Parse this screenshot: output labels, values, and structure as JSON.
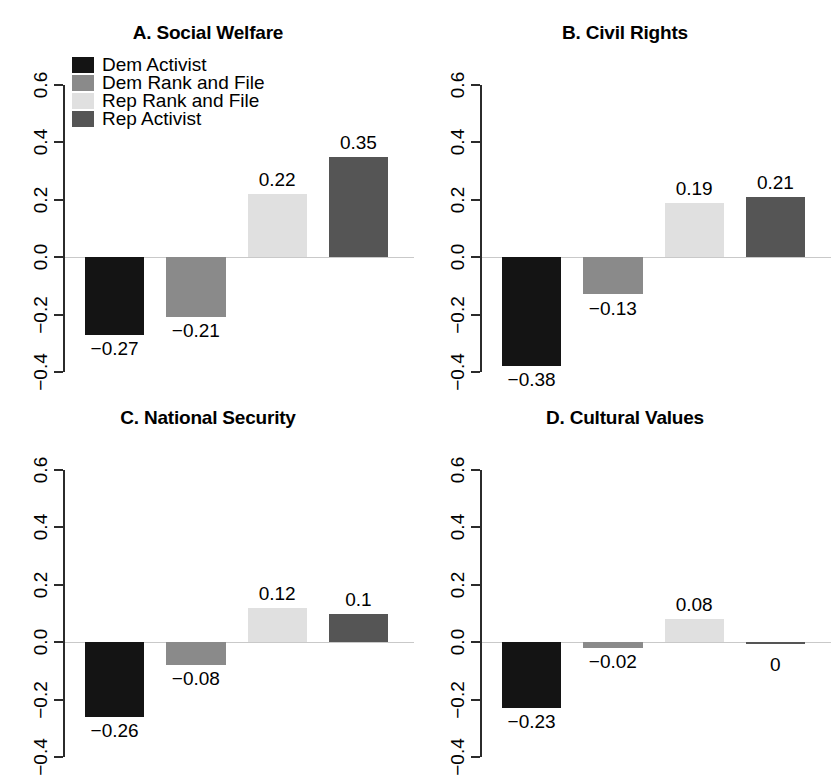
{
  "figure": {
    "width": 833,
    "height": 769,
    "background": "#ffffff"
  },
  "legend": {
    "position": "top-left-panel-a",
    "entries": [
      {
        "label": "Dem Activist",
        "color": "#141414"
      },
      {
        "label": "Dem Rank and File",
        "color": "#8a8a8a"
      },
      {
        "label": "Rep Rank and File",
        "color": "#e0e0e0"
      },
      {
        "label": "Rep Activist",
        "color": "#555555"
      }
    ]
  },
  "axis": {
    "ticks": [
      "0.6",
      "0.4",
      "0.2",
      "0.0",
      "-0.2",
      "-0.4"
    ],
    "tick_values": [
      0.6,
      0.4,
      0.2,
      0.0,
      -0.2,
      -0.4
    ],
    "ylim": [
      -0.4,
      0.6
    ]
  },
  "chart_data": [
    {
      "type": "bar",
      "title": "A. Social Welfare",
      "panel": "A",
      "xlabel": "",
      "ylabel": "",
      "ylim": [
        -0.4,
        0.6
      ],
      "grid": false,
      "legend_position": "top-left",
      "categories": [
        "Dem Activist",
        "Dem Rank and File",
        "Rep Rank and File",
        "Rep Activist"
      ],
      "values": [
        -0.27,
        -0.21,
        0.22,
        0.35
      ],
      "data_labels": [
        "-0.27",
        "-0.21",
        "0.22",
        "0.35"
      ],
      "colors": [
        "#141414",
        "#8a8a8a",
        "#e0e0e0",
        "#555555"
      ]
    },
    {
      "type": "bar",
      "title": "B. Civil Rights",
      "panel": "B",
      "xlabel": "",
      "ylabel": "",
      "ylim": [
        -0.4,
        0.6
      ],
      "grid": false,
      "categories": [
        "Dem Activist",
        "Dem Rank and File",
        "Rep Rank and File",
        "Rep Activist"
      ],
      "values": [
        -0.38,
        -0.13,
        0.19,
        0.21
      ],
      "data_labels": [
        "-0.38",
        "-0.13",
        "0.19",
        "0.21"
      ],
      "colors": [
        "#141414",
        "#8a8a8a",
        "#e0e0e0",
        "#555555"
      ]
    },
    {
      "type": "bar",
      "title": "C. National Security",
      "panel": "C",
      "xlabel": "",
      "ylabel": "",
      "ylim": [
        -0.4,
        0.6
      ],
      "grid": false,
      "categories": [
        "Dem Activist",
        "Dem Rank and File",
        "Rep Rank and File",
        "Rep Activist"
      ],
      "values": [
        -0.26,
        -0.08,
        0.12,
        0.1
      ],
      "data_labels": [
        "-0.26",
        "-0.08",
        "0.12",
        "0.1"
      ],
      "colors": [
        "#141414",
        "#8a8a8a",
        "#e0e0e0",
        "#555555"
      ]
    },
    {
      "type": "bar",
      "title": "D. Cultural Values",
      "panel": "D",
      "xlabel": "",
      "ylabel": "",
      "ylim": [
        -0.4,
        0.6
      ],
      "grid": false,
      "categories": [
        "Dem Activist",
        "Dem Rank and File",
        "Rep Rank and File",
        "Rep Activist"
      ],
      "values": [
        -0.23,
        -0.02,
        0.08,
        0
      ],
      "data_labels": [
        "-0.23",
        "-0.02",
        "0.08",
        "0"
      ],
      "colors": [
        "#141414",
        "#8a8a8a",
        "#e0e0e0",
        "#555555"
      ]
    }
  ]
}
